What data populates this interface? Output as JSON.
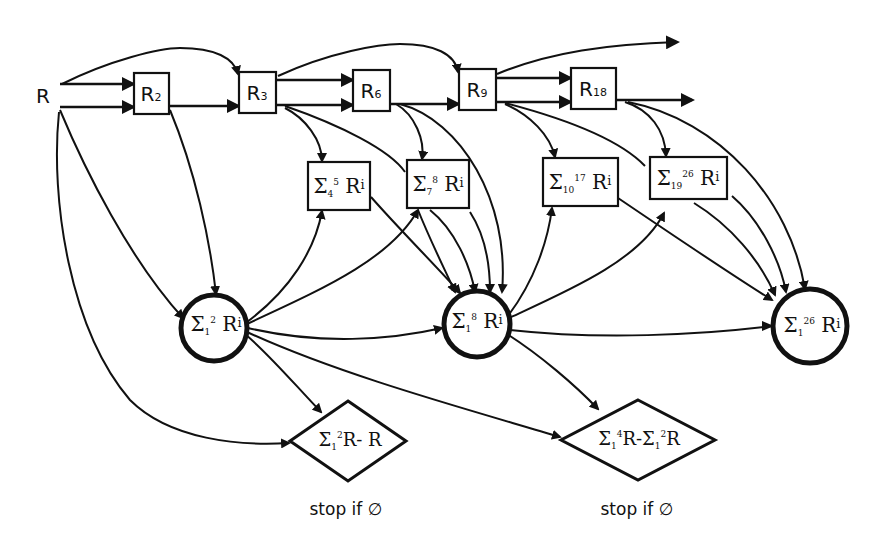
{
  "diagram": {
    "type": "computation-flow",
    "colors": {
      "stroke": "#111111",
      "background": "#ffffff"
    },
    "source": {
      "label": "R"
    },
    "register_nodes": [
      {
        "id": "R2",
        "base": "R",
        "sub": "2"
      },
      {
        "id": "R3",
        "base": "R",
        "sub": "3"
      },
      {
        "id": "R6",
        "base": "R",
        "sub": "6"
      },
      {
        "id": "R9",
        "base": "R",
        "sub": "9"
      },
      {
        "id": "R18",
        "base": "R",
        "sub": "18"
      }
    ],
    "partial_sum_nodes": [
      {
        "id": "S4_5",
        "sigma": "Σ",
        "lower": "4",
        "upper": "5",
        "term": "R",
        "index": "i"
      },
      {
        "id": "S7_8",
        "sigma": "Σ",
        "lower": "7",
        "upper": "8",
        "term": "R",
        "index": "i"
      },
      {
        "id": "S10_17",
        "sigma": "Σ",
        "lower": "10",
        "upper": "17",
        "term": "R",
        "index": "i"
      },
      {
        "id": "S19_26",
        "sigma": "Σ",
        "lower": "19",
        "upper": "26",
        "term": "R",
        "index": "i"
      }
    ],
    "accumulator_nodes": [
      {
        "id": "S1_2",
        "sigma": "Σ",
        "lower": "1",
        "upper": "2",
        "term": "R",
        "index": "i"
      },
      {
        "id": "S1_8",
        "sigma": "Σ",
        "lower": "1",
        "upper": "8",
        "term": "R",
        "index": "i"
      },
      {
        "id": "S1_26",
        "sigma": "Σ",
        "lower": "1",
        "upper": "26",
        "term": "R",
        "index": "i"
      }
    ],
    "decision_nodes": [
      {
        "id": "D1",
        "sigma": "Σ",
        "lower": "1",
        "upper": "2",
        "expr_tail": "R- R",
        "caption": "stop if ∅"
      },
      {
        "id": "D2",
        "sigma": "Σ",
        "lower": "1",
        "upper": "4",
        "expr_mid": "R-",
        "sigma2": "Σ",
        "lower2": "1",
        "upper2": "2",
        "expr_tail": "R",
        "caption": "stop if ∅"
      }
    ],
    "edges": [
      [
        "R",
        "R2"
      ],
      [
        "R",
        "R2"
      ],
      [
        "R",
        "R3"
      ],
      [
        "R",
        "S1_2"
      ],
      [
        "R",
        "D1"
      ],
      [
        "R2",
        "R3"
      ],
      [
        "R2",
        "S1_2"
      ],
      [
        "R3",
        "R6"
      ],
      [
        "R3",
        "R6"
      ],
      [
        "R3",
        "R9"
      ],
      [
        "R3",
        "S4_5"
      ],
      [
        "R3",
        "S1_8"
      ],
      [
        "R6",
        "R9"
      ],
      [
        "R6",
        "S7_8"
      ],
      [
        "R6",
        "S1_8"
      ],
      [
        "R9",
        "R18"
      ],
      [
        "R9",
        "R18"
      ],
      [
        "R9",
        "out_top"
      ],
      [
        "R9",
        "S10_17"
      ],
      [
        "R9",
        "S1_26"
      ],
      [
        "R18",
        "out_mid"
      ],
      [
        "R18",
        "S19_26"
      ],
      [
        "R18",
        "S1_26"
      ],
      [
        "S1_2",
        "S4_5"
      ],
      [
        "S1_2",
        "S7_8"
      ],
      [
        "S1_2",
        "S1_8"
      ],
      [
        "S1_2",
        "D1"
      ],
      [
        "S1_2",
        "D2"
      ],
      [
        "S4_5",
        "S1_8"
      ],
      [
        "S7_8",
        "S1_8"
      ],
      [
        "S1_8",
        "S10_17"
      ],
      [
        "S1_8",
        "S19_26"
      ],
      [
        "S1_8",
        "S1_26"
      ],
      [
        "S1_8",
        "D2"
      ],
      [
        "S10_17",
        "S1_26"
      ],
      [
        "S19_26",
        "S1_26"
      ]
    ]
  }
}
